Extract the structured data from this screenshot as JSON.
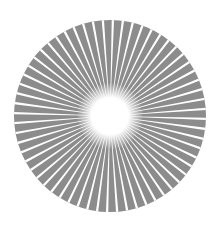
{
  "graphic": {
    "type": "radial-starburst",
    "center": [
      110,
      116
    ],
    "radius": 96,
    "ray_count": 60,
    "colors": {
      "background": "#ffffff",
      "disk": "#8c8c8c",
      "rays": "#ffffff",
      "center_glow": "#ffffff"
    },
    "center_glow_radius": 24
  }
}
